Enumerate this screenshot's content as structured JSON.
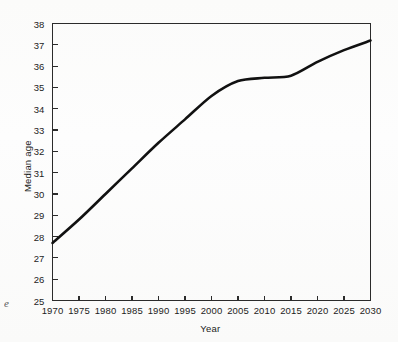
{
  "chart_data": {
    "type": "line",
    "title": "",
    "subtitle": "",
    "xlabel": "Year",
    "ylabel": "Median age",
    "x": [
      1970,
      1975,
      1980,
      1985,
      1990,
      1995,
      2000,
      2005,
      2010,
      2015,
      2020,
      2025,
      2030
    ],
    "values": [
      27.7,
      28.8,
      30.0,
      31.2,
      32.4,
      33.5,
      34.6,
      35.3,
      35.45,
      35.55,
      36.2,
      36.75,
      37.2
    ],
    "series": [
      {
        "name": "Median age",
        "values": [
          27.7,
          28.8,
          30.0,
          31.2,
          32.4,
          33.5,
          34.6,
          35.3,
          35.45,
          35.55,
          36.2,
          36.75,
          37.2
        ]
      }
    ],
    "xlim": [
      1970,
      2030
    ],
    "ylim": [
      25,
      38
    ],
    "xticks": [
      1970,
      1975,
      1980,
      1985,
      1990,
      1995,
      2000,
      2005,
      2010,
      2015,
      2020,
      2025,
      2030
    ],
    "yticks": [
      25,
      26,
      27,
      28,
      29,
      30,
      31,
      32,
      33,
      34,
      35,
      36,
      37,
      38
    ],
    "xtick_labels": [
      "1970",
      "1975",
      "1980",
      "1985",
      "1990",
      "1995",
      "2000",
      "2005",
      "2010",
      "2015",
      "2020",
      "2025",
      "2030"
    ],
    "ytick_labels": [
      "25",
      "26",
      "27",
      "28",
      "29",
      "30",
      "31",
      "32",
      "33",
      "34",
      "35",
      "36",
      "37",
      "38"
    ],
    "grid": false,
    "legend": "none",
    "annotations": [],
    "line_color": "#111111",
    "axis_color": "#2b2b2b",
    "background_color": "#fdfdfc"
  },
  "caption": {
    "fragment": "e"
  }
}
